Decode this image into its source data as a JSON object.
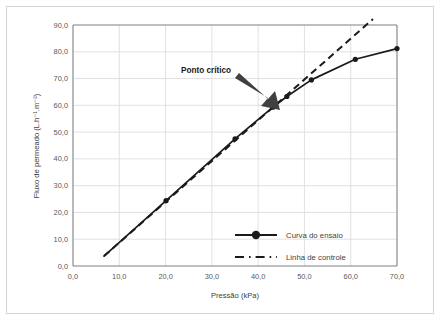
{
  "chart_data": {
    "type": "line",
    "title": "",
    "xlabel": "Pressão (kPa)",
    "ylabel": "Fluxo de permeado (L.h⁻¹.m⁻²)",
    "xlim": [
      0.0,
      70.0
    ],
    "ylim": [
      0.0,
      90.0
    ],
    "xticks": [
      0.0,
      10.0,
      20.0,
      30.0,
      40.0,
      50.0,
      60.0,
      70.0
    ],
    "xtick_labels": [
      "0,0",
      "10,0",
      "20,0",
      "30,0",
      "40,0",
      "50,0",
      "60,0",
      "70,0"
    ],
    "yticks": [
      0.0,
      10.0,
      20.0,
      30.0,
      40.0,
      50.0,
      60.0,
      70.0,
      80.0,
      90.0
    ],
    "ytick_labels": [
      "0,0",
      "10,0",
      "20,0",
      "30,0",
      "40,0",
      "50,0",
      "60,0",
      "70,0",
      "80,0",
      "90,0"
    ],
    "grid": "horizontal-and-vertical",
    "grid_color": "#d9d9d9",
    "legend_position": "inside-bottom-right",
    "series": [
      {
        "name": "Curva do ensaio",
        "style": "solid-with-markers",
        "color": "#1a1a1a",
        "marker": "circle",
        "points": [
          {
            "x": 6.7,
            "y": 3.7
          },
          {
            "x": 20.1,
            "y": 24.4
          },
          {
            "x": 35.0,
            "y": 47.5
          },
          {
            "x": 43.2,
            "y": 59.3
          },
          {
            "x": 46.2,
            "y": 63.3
          },
          {
            "x": 51.5,
            "y": 69.5
          },
          {
            "x": 61.0,
            "y": 77.2
          },
          {
            "x": 70.0,
            "y": 81.2
          }
        ],
        "markers_at": [
          {
            "x": 20.1,
            "y": 24.4
          },
          {
            "x": 35.0,
            "y": 47.5
          },
          {
            "x": 43.2,
            "y": 59.3
          },
          {
            "x": 46.2,
            "y": 63.3
          },
          {
            "x": 51.5,
            "y": 69.5
          },
          {
            "x": 61.0,
            "y": 77.2
          },
          {
            "x": 70.0,
            "y": 81.2
          }
        ]
      },
      {
        "name": "Linha de controle",
        "style": "dashed",
        "color": "#1a1a1a",
        "points": [
          {
            "x": 6.7,
            "y": 3.7
          },
          {
            "x": 64.8,
            "y": 92.2
          }
        ]
      }
    ],
    "annotations": [
      {
        "text": "Ponto crítico",
        "target": {
          "x": 43.2,
          "y": 59.3
        },
        "marker": "arrow"
      }
    ]
  },
  "legend": {
    "items": [
      {
        "label": "Curva do ensaio"
      },
      {
        "label": "Linha de controle"
      }
    ]
  },
  "axes": {
    "x_title": "Pressão (kPa)",
    "y_title": "Fluxo de permeado (L.h⁻¹.m⁻²)"
  },
  "annotation": {
    "critical_point_label": "Ponto crítico"
  }
}
